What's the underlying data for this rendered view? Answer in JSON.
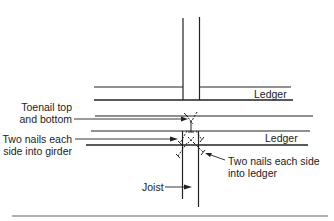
{
  "diagram": {
    "title": "",
    "labels": {
      "ledger_top": "Ledger",
      "ledger_bottom": "Ledger",
      "toenail_line1": "Toenail top",
      "toenail_line2": "and bottom",
      "girder_line1": "Two nails each",
      "girder_line2": "side into girder",
      "ledger_nails_line1": "Two nails each side",
      "ledger_nails_line2": "into ledger",
      "joist": "Joist"
    },
    "colors": {
      "line": "#222222",
      "background": "#ffffff"
    }
  }
}
